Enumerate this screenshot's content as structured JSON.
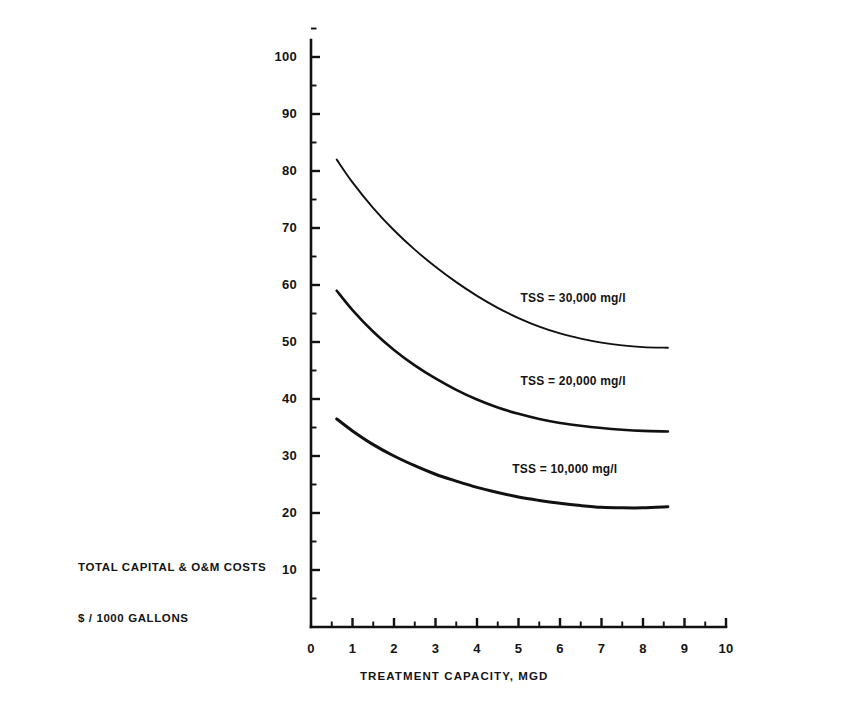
{
  "chart_data": {
    "type": "line",
    "title": "",
    "xlabel": "TREATMENT CAPACITY, MGD",
    "ylabel_line1": "TOTAL CAPITAL & O&M COSTS",
    "ylabel_line2": "$ / 1000 GALLONS",
    "xlim": [
      0,
      10
    ],
    "ylim": [
      0,
      105
    ],
    "xticks": [
      0,
      1,
      2,
      3,
      4,
      5,
      6,
      7,
      8,
      9,
      10
    ],
    "xtick_labels": [
      "0",
      "1",
      "2",
      "3",
      "4",
      "5",
      "6",
      "7",
      "8",
      "9",
      "10"
    ],
    "xminor_step": 0.5,
    "yticks": [
      10,
      20,
      30,
      40,
      50,
      60,
      70,
      80,
      90,
      100
    ],
    "ytick_labels": [
      "10",
      "20",
      "30",
      "40",
      "50",
      "60",
      "70",
      "80",
      "90",
      "100"
    ],
    "yminor_step": 5,
    "grid": false,
    "legend_position": "inline-annotations",
    "line_color": "#111111",
    "background_color": "#ffffff",
    "series": [
      {
        "name": "TSS = 30,000 mg/l",
        "label": "TSS = 30,000 mg/l",
        "label_x": 5.05,
        "label_y": 57.5,
        "x": [
          0.62,
          1.0,
          1.5,
          2.0,
          2.5,
          3.0,
          3.5,
          4.0,
          4.5,
          5.0,
          5.5,
          6.0,
          6.5,
          7.0,
          7.5,
          8.0,
          8.6
        ],
        "values": [
          82.0,
          78.0,
          73.5,
          69.6,
          66.2,
          63.2,
          60.5,
          58.1,
          56.0,
          54.2,
          52.7,
          51.5,
          50.6,
          49.9,
          49.4,
          49.1,
          49.0
        ]
      },
      {
        "name": "TSS = 20,000 mg/l",
        "label": "TSS = 20,000 mg/l",
        "label_x": 5.05,
        "label_y": 43.0,
        "x": [
          0.62,
          1.0,
          1.5,
          2.0,
          2.5,
          3.0,
          3.5,
          4.0,
          4.5,
          5.0,
          5.5,
          6.0,
          6.5,
          7.0,
          7.5,
          8.0,
          8.6
        ],
        "values": [
          59.0,
          55.6,
          51.8,
          48.6,
          45.9,
          43.6,
          41.6,
          39.9,
          38.5,
          37.4,
          36.5,
          35.8,
          35.3,
          34.9,
          34.6,
          34.4,
          34.3
        ]
      },
      {
        "name": "TSS = 10,000 mg/l",
        "label": "TSS = 10,000 mg/l",
        "label_x": 4.85,
        "label_y": 27.5,
        "x": [
          0.62,
          1.0,
          1.5,
          2.0,
          2.5,
          3.0,
          3.5,
          4.0,
          4.5,
          5.0,
          5.5,
          6.0,
          6.5,
          7.0,
          7.5,
          8.0,
          8.6
        ],
        "values": [
          36.5,
          34.4,
          32.0,
          30.0,
          28.3,
          26.8,
          25.6,
          24.5,
          23.6,
          22.8,
          22.2,
          21.7,
          21.3,
          21.0,
          20.9,
          20.9,
          21.1
        ]
      }
    ]
  }
}
